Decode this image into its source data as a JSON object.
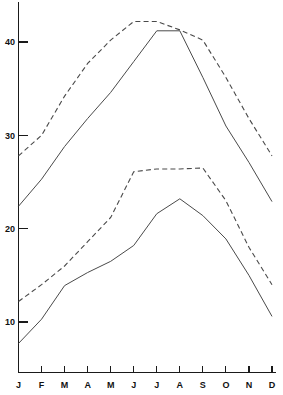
{
  "chart_data": {
    "type": "line",
    "title": "",
    "subtitle": "",
    "xlabel": "",
    "ylabel": "",
    "categories": [
      "J",
      "F",
      "M",
      "A",
      "M",
      "J",
      "J",
      "A",
      "S",
      "O",
      "N",
      "D"
    ],
    "xtick_labels": [
      "J",
      "F",
      "M",
      "A",
      "M",
      "J",
      "J",
      "A",
      "S",
      "O",
      "N",
      "D"
    ],
    "ytick_labels": [
      "10",
      "20",
      "30",
      "40"
    ],
    "ytick_values": [
      10,
      20,
      30,
      40
    ],
    "ylim": [
      4,
      44
    ],
    "xlim": [
      0,
      11
    ],
    "grid": false,
    "legend": false,
    "legend_position": "none",
    "axis_color": "#1a1a1a",
    "line_color": "#4a4a4a",
    "series": [
      {
        "name": "upper-dashed",
        "style": "dashed",
        "values": [
          27.8,
          30.0,
          34.2,
          37.7,
          40.2,
          42.2,
          42.2,
          41.3,
          40.2,
          36.2,
          31.8,
          27.8
        ]
      },
      {
        "name": "upper-solid",
        "style": "solid",
        "values": [
          22.4,
          25.3,
          28.8,
          31.8,
          34.6,
          37.9,
          41.2,
          41.2,
          36.2,
          31.0,
          27.1,
          22.9
        ]
      },
      {
        "name": "lower-dashed",
        "style": "dashed",
        "values": [
          12.2,
          14.0,
          16.0,
          18.6,
          21.2,
          26.1,
          26.4,
          26.4,
          26.5,
          23.0,
          18.0,
          14.0
        ]
      },
      {
        "name": "lower-solid",
        "style": "solid",
        "values": [
          7.7,
          10.3,
          13.9,
          15.3,
          16.5,
          18.2,
          21.6,
          23.2,
          21.4,
          18.9,
          15.0,
          10.6
        ]
      }
    ]
  },
  "axis": {
    "y_axis_name": "value-axis",
    "x_axis_name": "month-axis"
  }
}
